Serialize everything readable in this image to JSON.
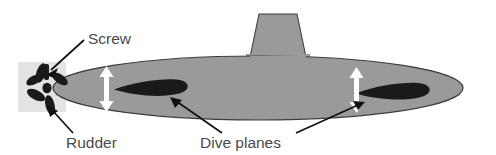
{
  "figure": {
    "background_color": "#ffffff"
  },
  "labels": [
    {
      "id": "screw",
      "text": "Screw",
      "x": 88,
      "y": 44,
      "anchor": "start",
      "points_to": "propeller"
    },
    {
      "id": "rudder",
      "text": "Rudder",
      "x": 66,
      "y": 148,
      "anchor": "start",
      "points_to": "rudder-block"
    },
    {
      "id": "dive-planes",
      "text": "Dive planes",
      "x": 200,
      "y": 148,
      "anchor": "start",
      "points_to": "dive-plane-left, dive-plane-right"
    }
  ],
  "colors": {
    "hull_fill": "#9a9a9a",
    "hull_stroke": "#3c3c3c",
    "dive_plane_fill": "#1a1a1a",
    "rudder_block_fill": "#e3e3e3",
    "propeller_fill": "#1a1a1a",
    "leader_line": "#111111",
    "motion_arrow": "#ffffff",
    "label_text": "#4a4a4a"
  },
  "parts": [
    {
      "id": "hull",
      "name": "hull",
      "shape": "ellipse",
      "cx": 258,
      "cy": 88,
      "rx": 205,
      "ry": 32
    },
    {
      "id": "sail",
      "name": "conning-tower",
      "shape": "trapezoid",
      "top_y": 14,
      "base_y": 62
    },
    {
      "id": "dive-plane-left",
      "name": "dive-plane-left",
      "shape": "teardrop",
      "cx": 150,
      "cy": 87
    },
    {
      "id": "dive-plane-right",
      "name": "dive-plane-right",
      "shape": "teardrop",
      "cx": 390,
      "cy": 91
    },
    {
      "id": "propeller",
      "name": "screw-propeller",
      "shape": "five-blade",
      "cx": 47,
      "cy": 88
    },
    {
      "id": "rudder-block",
      "name": "rudder-block",
      "shape": "rect",
      "x": 18,
      "y": 62,
      "w": 48,
      "h": 50
    }
  ],
  "motion_arrows": [
    {
      "id": "arrow-left",
      "name": "dive-plane-left-motion-arrow",
      "x": 107,
      "y_top": 69,
      "y_bottom": 108
    },
    {
      "id": "arrow-right",
      "name": "dive-plane-right-motion-arrow",
      "x": 357,
      "y_top": 70,
      "y_bottom": 109
    }
  ]
}
